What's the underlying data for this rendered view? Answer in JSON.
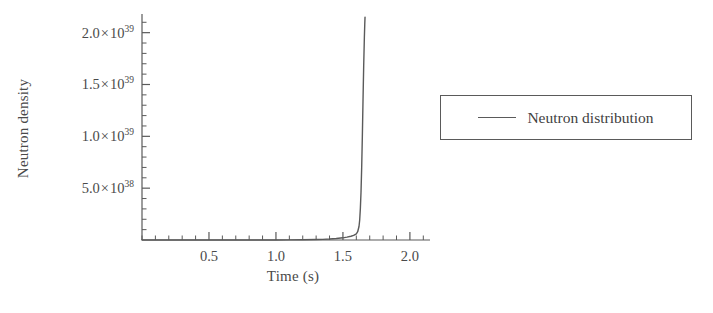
{
  "chart_data": {
    "type": "line",
    "title": "",
    "xlabel": "Time (s)",
    "ylabel": "Neutron density",
    "xlim": [
      0,
      2.15
    ],
    "ylim": [
      0,
      2.18e+39
    ],
    "grid": false,
    "legend_position": "right",
    "x_ticks": [
      {
        "value": 0.5,
        "label": "0.5"
      },
      {
        "value": 1.0,
        "label": "1.0"
      },
      {
        "value": 1.5,
        "label": "1.5"
      },
      {
        "value": 2.0,
        "label": "2.0"
      }
    ],
    "x_minor_tick_count_between": 4,
    "y_ticks": [
      {
        "value": 5e+38,
        "mantissa": "5.0",
        "exponent": "38",
        "label": "5.0 × 10^38"
      },
      {
        "value": 1e+39,
        "mantissa": "1.0",
        "exponent": "39",
        "label": "1.0 × 10^39"
      },
      {
        "value": 1.5e+39,
        "mantissa": "1.5",
        "exponent": "39",
        "label": "1.5 × 10^39"
      },
      {
        "value": 2e+39,
        "mantissa": "2.0",
        "exponent": "39",
        "label": "2.0 × 10^39"
      }
    ],
    "y_minor_tick_count_between": 4,
    "multiplication_sign": "×",
    "series": [
      {
        "name": "Neutron distribution",
        "color": "#5a5a5a",
        "x": [
          0.0,
          0.2,
          0.4,
          0.6,
          0.8,
          1.0,
          1.1,
          1.2,
          1.3,
          1.35,
          1.4,
          1.45,
          1.5,
          1.53,
          1.56,
          1.58,
          1.6,
          1.61,
          1.62,
          1.625,
          1.63,
          1.635,
          1.64,
          1.645,
          1.65,
          1.655,
          1.66,
          1.663,
          1.665
        ],
        "y": [
          1e+32,
          5e+32,
          2.6e+33,
          1.3e+34,
          6.8e+34,
          3.5e+35,
          7.9e+35,
          1.8e+36,
          4.1e+36,
          6.2e+36,
          9.3e+36,
          1.4e+37,
          2.1e+37,
          2.8e+37,
          3.6e+37,
          4.4e+37,
          6e+37,
          8e+37,
          1.3e+38,
          1.9e+38,
          3e+38,
          4.6e+38,
          7e+38,
          1e+39,
          1.35e+39,
          1.68e+39,
          1.95e+39,
          2.08e+39,
          2.15e+39
        ]
      }
    ],
    "legend": [
      {
        "label": "Neutron distribution",
        "marker": "line",
        "color": "#5a5a5a"
      }
    ]
  },
  "axis": {
    "line_color": "#5a5a5a"
  }
}
